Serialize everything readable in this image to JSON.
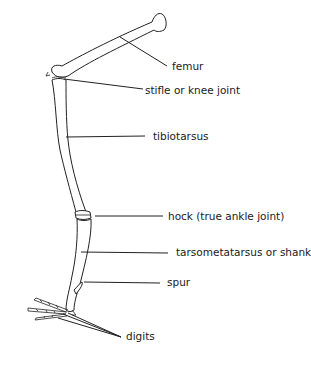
{
  "diagram": {
    "type": "anatomical-labeled-illustration",
    "labels": [
      {
        "id": "femur",
        "text": "femur"
      },
      {
        "id": "stifle",
        "text": "stifle or knee joint"
      },
      {
        "id": "tibiotarsus",
        "text": "tibiotarsus"
      },
      {
        "id": "hock",
        "text": "hock (true ankle joint)"
      },
      {
        "id": "tarsometatarsus",
        "text": "tarsometatarsus or shank"
      },
      {
        "id": "spur",
        "text": "spur"
      },
      {
        "id": "digits",
        "text": "digits"
      }
    ],
    "colors": {
      "line": "#222222",
      "background": "#ffffff",
      "text": "#1a1a1a"
    }
  }
}
